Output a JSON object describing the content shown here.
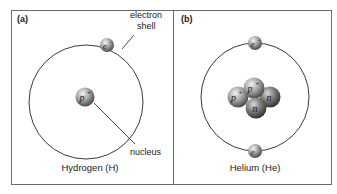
{
  "figure": {
    "panels": [
      {
        "id": "a",
        "label": "(a)",
        "caption": "Hydrogen (H)",
        "callouts": {
          "shell_line1": "electron",
          "shell_line2": "shell",
          "nucleus": "nucleus"
        },
        "particles": {
          "proton": "p",
          "proton_charge": "+",
          "electron": "e",
          "electron_charge": "−"
        }
      },
      {
        "id": "b",
        "label": "(b)",
        "caption": "Helium (He)",
        "particles": {
          "proton": "p",
          "proton_charge": "+",
          "neutron": "n",
          "electron": "e",
          "electron_charge": "−"
        }
      }
    ],
    "colors": {
      "frame": "#6b6b6b",
      "shell": "#3a3a3a",
      "particle_light": "#e6e6e6",
      "particle_mid": "#9a9a9a",
      "particle_dark": "#3c3c3c"
    }
  }
}
